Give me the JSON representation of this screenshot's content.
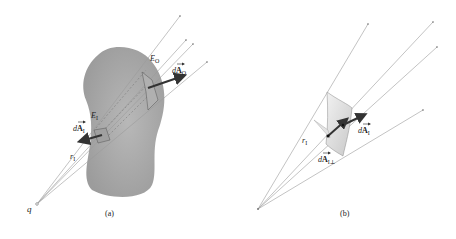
{
  "panels": [
    {
      "id": "a",
      "caption": "(a)",
      "charge_label": "q",
      "outer_field_label": "E",
      "outer_field_sub": "O",
      "outer_area_label_d": "d",
      "outer_area_label_A": "A",
      "outer_area_sub": "O",
      "inner_field_label": "E",
      "inner_field_sub": "I",
      "inner_area_label_d": "d",
      "inner_area_label_A": "A",
      "inner_area_sub": "I",
      "radius_label": "r",
      "radius_sub": "I"
    },
    {
      "id": "b",
      "caption": "(b)",
      "radius_label": "r",
      "radius_sub": "I",
      "area_label_d": "d",
      "area_label_A": "A",
      "area_sub": "I",
      "perp_area_label_d": "d",
      "perp_area_label_A": "A",
      "perp_area_sub": "I⊥"
    }
  ],
  "colors": {
    "blob_fill": "#a8a8a8",
    "ray_line": "#9a9a9a",
    "arrow": "#333333",
    "patch_fill": "#dcdcdc"
  }
}
